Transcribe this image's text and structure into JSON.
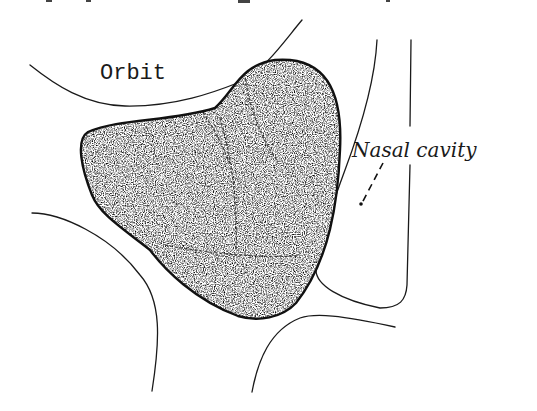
{
  "figure": {
    "type": "anatomical-sketch",
    "labels": {
      "orbit": "Orbit",
      "nasal_cavity": "Nasal cavity"
    },
    "regions": [
      {
        "name": "orbit",
        "style": "outline"
      },
      {
        "name": "stippled-mass",
        "style": "stippled-fill-bold-outline"
      },
      {
        "name": "nasal-cavity",
        "style": "outline"
      }
    ],
    "colors": {
      "background": "#ffffff",
      "ink": "#1a1a1a",
      "stipple": "#555555"
    }
  }
}
